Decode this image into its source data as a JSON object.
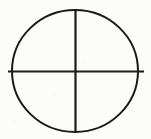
{
  "figure": {
    "background_color": "#fcfcfb",
    "stroke_color": "#1a1a1a",
    "canvas": {
      "width": 151,
      "height": 139
    },
    "circle": {
      "label": "circle-outline",
      "center_x": 75,
      "center_y": 71,
      "radius_x": 63,
      "radius_y": 61,
      "stroke_width": 2.0
    },
    "vertical_line": {
      "label": "vertical-diameter",
      "x": 75,
      "y_start": 9,
      "y_end": 132,
      "stroke_width": 2.2
    },
    "horizontal_line": {
      "label": "horizontal-diameter",
      "y": 71,
      "x_start": 8,
      "x_end": 144,
      "stroke_width": 2.2
    }
  }
}
